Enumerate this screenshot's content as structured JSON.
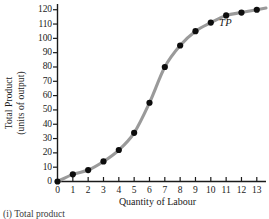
{
  "figure": {
    "caption": "(i) Total product",
    "series_label": "TP"
  },
  "chart_data": {
    "type": "line",
    "title": "",
    "xlabel": "Quantity of Labour",
    "ylabel": "Total Product (units of output)",
    "ylabel_line1": "Total Product",
    "ylabel_line2": "(units of output)",
    "series_name": "TP",
    "x": [
      0,
      1,
      2,
      3,
      4,
      5,
      6,
      7,
      8,
      9,
      10,
      11,
      12,
      13
    ],
    "values": [
      0,
      5,
      8,
      14,
      22,
      34,
      55,
      80,
      95,
      105,
      111,
      116,
      118,
      120
    ],
    "xlim": [
      0,
      13.6
    ],
    "ylim": [
      0,
      124
    ],
    "xticks": [
      "0",
      "1",
      "2",
      "3",
      "4",
      "5",
      "6",
      "7",
      "8",
      "9",
      "10",
      "11",
      "12",
      "13"
    ],
    "yticks": [
      "0",
      "10",
      "20",
      "30",
      "40",
      "50",
      "60",
      "70",
      "80",
      "90",
      "100",
      "110",
      "120"
    ],
    "grid": false,
    "legend": "annotation-right",
    "line_color": "#9a9a9a",
    "marker_color": "#0d0d0d",
    "axis_color": "#1a1a1a",
    "background": "#ffffff"
  }
}
